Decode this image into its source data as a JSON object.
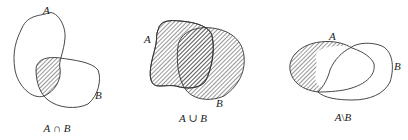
{
  "diagram": {
    "type": "venn-set-operations",
    "style": {
      "stroke_color": "#333333",
      "hatch_color": "#333333",
      "background": "#ffffff"
    },
    "panels": [
      {
        "id": "intersection",
        "set_a_label": "A",
        "set_b_label": "B",
        "caption_left": "A",
        "caption_op": " ∩ ",
        "caption_right": "B",
        "shaded_region": "A ∩ B"
      },
      {
        "id": "union",
        "set_a_label": "A",
        "set_b_label": "B",
        "caption_left": "A",
        "caption_op": " ∪ ",
        "caption_right": "B",
        "shaded_region": "A ∪ B"
      },
      {
        "id": "difference",
        "set_a_label": "A",
        "set_b_label": "B",
        "caption_left": "A",
        "caption_op": "\\",
        "caption_right": "B",
        "shaded_region": "A \\ B"
      }
    ]
  }
}
